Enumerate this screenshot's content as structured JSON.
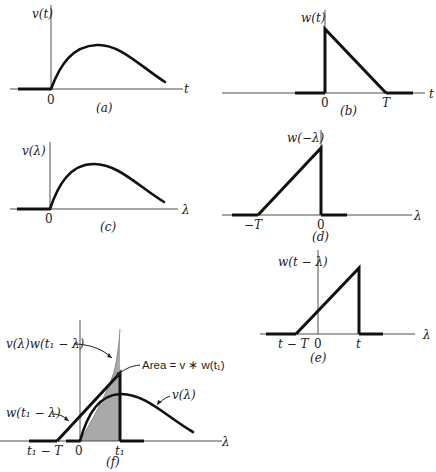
{
  "panels": {
    "a": {
      "caption": "(a)",
      "y_label": "v(t)",
      "x_label": "t",
      "origin_label": "0"
    },
    "b": {
      "caption": "(b)",
      "y_label": "w(t)",
      "x_label": "t",
      "origin_label": "0",
      "end_label": "T"
    },
    "c": {
      "caption": "(c)",
      "y_label": "v(λ)",
      "x_label": "λ",
      "origin_label": "0"
    },
    "d": {
      "caption": "(d)",
      "y_label": "w(−λ)",
      "x_label": "λ",
      "origin_label": "0",
      "start_label": "−T"
    },
    "e": {
      "caption": "(e)",
      "y_label": "w(t − λ)",
      "x_label": "λ",
      "origin_label": "0",
      "start_label": "t − T",
      "end_label": "t"
    },
    "f": {
      "caption": "(f)",
      "x_label": "λ",
      "origin_label": "0",
      "start_label": "t₁ − T",
      "end_label": "t₁",
      "product_label": "v(λ)w(t₁ − λ)",
      "area_label": "Area = v ∗ w(t₁)",
      "v_label": "v(λ)",
      "w_label": "w(t₁ − λ)"
    }
  },
  "colors": {
    "shade": "#a9a9a9",
    "ink": "#111111"
  }
}
